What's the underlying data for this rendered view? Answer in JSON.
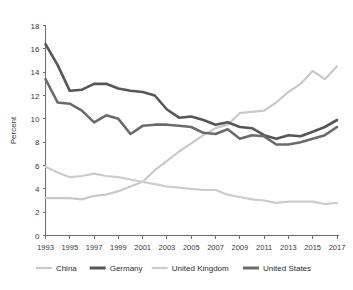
{
  "chart_data": {
    "type": "line",
    "title": "",
    "xlabel": "",
    "ylabel": "Percent",
    "ylim": [
      0,
      18
    ],
    "ytick_step": 2,
    "yticks": [
      "0",
      "2",
      "4",
      "6",
      "8",
      "10",
      "12",
      "14",
      "16",
      "18"
    ],
    "xlim": [
      1993,
      2017
    ],
    "xticks": [
      "1993",
      "1995",
      "1997",
      "1999",
      "2001",
      "2003",
      "2005",
      "2007",
      "2009",
      "2011",
      "2013",
      "2015",
      "2017"
    ],
    "xtick_step": 2,
    "grid": false,
    "legend_position": "bottom",
    "x": [
      1993,
      1994,
      1995,
      1996,
      1997,
      1998,
      1999,
      2000,
      2001,
      2002,
      2003,
      2004,
      2005,
      2006,
      2007,
      2008,
      2009,
      2010,
      2011,
      2012,
      2013,
      2014,
      2015,
      2016,
      2017
    ],
    "series": [
      {
        "name": "China",
        "color": "#c9c9c9",
        "width": 2.2,
        "values": [
          3.2,
          3.2,
          3.2,
          3.1,
          3.4,
          3.5,
          3.8,
          4.2,
          4.6,
          5.6,
          6.4,
          7.2,
          7.9,
          8.6,
          9.2,
          9.5,
          10.5,
          10.6,
          10.7,
          11.4,
          12.3,
          13.0,
          14.1,
          13.4,
          14.5
        ]
      },
      {
        "name": "Germany",
        "color": "#565656",
        "width": 2.6,
        "values": [
          16.4,
          14.6,
          12.4,
          12.5,
          13.0,
          13.0,
          12.6,
          12.4,
          12.3,
          12.0,
          10.8,
          10.1,
          10.2,
          9.9,
          9.5,
          9.7,
          9.3,
          9.2,
          8.6,
          8.3,
          8.6,
          8.5,
          8.9,
          9.3,
          9.9
        ]
      },
      {
        "name": "United Kingdom",
        "color": "#cccccc",
        "width": 2.2,
        "values": [
          5.9,
          5.4,
          5.0,
          5.1,
          5.3,
          5.1,
          5.0,
          4.8,
          4.6,
          4.4,
          4.2,
          4.1,
          4.0,
          3.9,
          3.9,
          3.5,
          3.3,
          3.1,
          3.0,
          2.8,
          2.9,
          2.9,
          2.9,
          2.7,
          2.8
        ]
      },
      {
        "name": "United States",
        "color": "#6b6b6b",
        "width": 2.6,
        "values": [
          13.4,
          11.4,
          11.3,
          10.7,
          9.7,
          10.3,
          10.0,
          8.7,
          9.4,
          9.5,
          9.5,
          9.4,
          9.3,
          8.8,
          8.7,
          9.1,
          8.3,
          8.6,
          8.5,
          7.8,
          7.8,
          8.0,
          8.3,
          8.6,
          9.3
        ]
      }
    ]
  },
  "legend": {
    "items": [
      {
        "label": "China",
        "color": "#c9c9c9",
        "width": 2.2
      },
      {
        "label": "Germany",
        "color": "#565656",
        "width": 3.0
      },
      {
        "label": "United Kingdom",
        "color": "#cccccc",
        "width": 2.2
      },
      {
        "label": "United States",
        "color": "#6b6b6b",
        "width": 3.0
      }
    ]
  },
  "axis": {
    "y_title": "Percent"
  }
}
